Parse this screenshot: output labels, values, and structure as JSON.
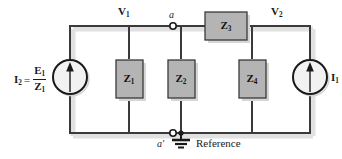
{
  "diagram": {
    "type": "electrical-circuit-schematic",
    "colors": {
      "wire": "#3a3a3a",
      "box_fill": "#b4b4b4",
      "box_border": "#3a3a3a",
      "shadow": "#d8d8d8",
      "text": "#1a1a1a",
      "background": "#ffffff"
    },
    "sources": [
      {
        "id": "source-left",
        "label_plain": "I2 = E1 / Z1",
        "lhs_symbol": "I",
        "lhs_sub": "2",
        "equals": "=",
        "numerator_symbol": "E",
        "numerator_sub": "1",
        "denominator_symbol": "Z",
        "denominator_sub": "1",
        "arrow_direction": "up",
        "symbol": "current-source"
      },
      {
        "id": "source-right",
        "label_plain": "I1",
        "symbol_letter": "I",
        "symbol_sub": "1",
        "arrow_direction": "up",
        "symbol": "current-source"
      }
    ],
    "impedances": [
      {
        "id": "Z1",
        "letter": "Z",
        "sub": "1",
        "orientation": "vertical"
      },
      {
        "id": "Z2",
        "letter": "Z",
        "sub": "2",
        "orientation": "vertical"
      },
      {
        "id": "Z3",
        "letter": "Z",
        "sub": "3",
        "orientation": "horizontal"
      },
      {
        "id": "Z4",
        "letter": "Z",
        "sub": "4",
        "orientation": "vertical"
      }
    ],
    "node_voltages": [
      {
        "id": "V1",
        "letter": "V",
        "sub": "1"
      },
      {
        "id": "V2",
        "letter": "V",
        "sub": "2"
      }
    ],
    "node_terminals": [
      {
        "id": "a",
        "label": "a",
        "prime": ""
      },
      {
        "id": "a-prime",
        "label": "a",
        "prime": "′"
      }
    ],
    "ground": {
      "label": "Reference",
      "symbol": "earth-ground"
    }
  }
}
